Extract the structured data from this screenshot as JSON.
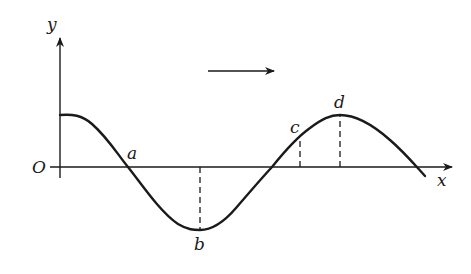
{
  "diagram": {
    "type": "transverse-wave",
    "axes": {
      "x_label": "x",
      "y_label": "y",
      "origin_label": "O"
    },
    "propagation_direction": "right",
    "points": [
      {
        "id": "a",
        "label": "a",
        "description": "zero crossing (equilibrium position), curve descending"
      },
      {
        "id": "b",
        "label": "b",
        "description": "trough (minimum displacement)"
      },
      {
        "id": "c",
        "label": "c",
        "description": "point between zero crossing and crest, positive displacement"
      },
      {
        "id": "d",
        "label": "d",
        "description": "crest (maximum displacement)"
      }
    ],
    "colors": {
      "stroke": "#1a1a1a",
      "background": "#ffffff"
    }
  }
}
